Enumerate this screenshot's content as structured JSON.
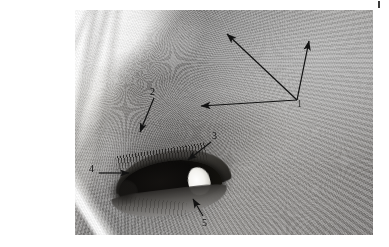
{
  "figure": {
    "type": "annotated-photograph",
    "rendering": "black-and-white photograph",
    "canvas": {
      "width": 389,
      "height": 247,
      "background": "#ffffff"
    },
    "plate": {
      "x": 75,
      "y": 10,
      "width": 298,
      "height": 225
    },
    "corner_mark": {
      "name": "registration-tick",
      "x": 378,
      "y": 1,
      "width": 2,
      "height": 7,
      "color": "#3a3a3a"
    }
  },
  "palette": {
    "ink": "#121212",
    "paper": "#ffffff",
    "midtone": "#8e8e8e",
    "highlight": "#ffffff",
    "shadow": "#0b0a09"
  },
  "annotations": {
    "leader_color": "#121212",
    "items": [
      {
        "id": "callout-1",
        "label": "1",
        "label_x": 299,
        "label_y": 104,
        "hub": {
          "x": 297,
          "y": 100
        },
        "arrow_count": 3,
        "arrow_tips": [
          {
            "x": 225,
            "y": 32
          },
          {
            "x": 310,
            "y": 38
          },
          {
            "x": 198,
            "y": 106
          }
        ]
      },
      {
        "id": "callout-2",
        "label": "2",
        "label_x": 152,
        "label_y": 92,
        "tail": {
          "x": 154,
          "y": 98
        },
        "tip": {
          "x": 139,
          "y": 134
        },
        "arrow_count": 1
      },
      {
        "id": "callout-3",
        "label": "3",
        "label_x": 214,
        "label_y": 136,
        "tail": {
          "x": 211,
          "y": 142
        },
        "tip": {
          "x": 186,
          "y": 161
        },
        "arrow_count": 1
      },
      {
        "id": "callout-4",
        "label": "4",
        "label_x": 91,
        "label_y": 169,
        "tail": {
          "x": 99,
          "y": 173
        },
        "tip": {
          "x": 131,
          "y": 173
        },
        "arrow_count": 1
      },
      {
        "id": "callout-5",
        "label": "5",
        "label_x": 204,
        "label_y": 223,
        "tail": {
          "x": 203,
          "y": 216
        },
        "tip": {
          "x": 191,
          "y": 197
        },
        "arrow_count": 1
      }
    ]
  }
}
